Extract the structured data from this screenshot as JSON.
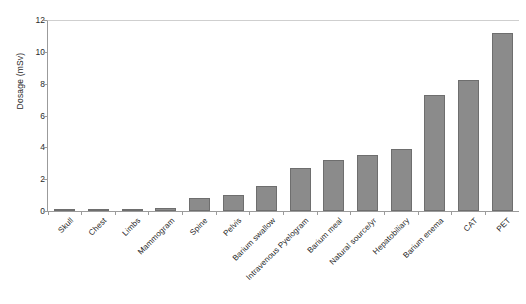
{
  "chart_data": {
    "type": "bar",
    "title": "",
    "xlabel": "",
    "ylabel": "Dosage (mSv)",
    "ylim": [
      0,
      12
    ],
    "yticks": [
      0,
      2,
      4,
      6,
      8,
      10,
      12
    ],
    "grid": false,
    "legend": false,
    "bar_color": "#8b8b8b",
    "bar_edge_color": "#6e6e6e",
    "axis_color": "#9b9b9b",
    "categories": [
      "Skull",
      "Chest",
      "Limbs",
      "Mammogram",
      "Spine",
      "Pelvis",
      "Barium swallow",
      "Intravenous Pyelogram",
      "Barium meal",
      "Natural source/yr",
      "Hepatobiliary",
      "Barium enema",
      "CAT",
      "PET"
    ],
    "values": [
      0.06,
      0.06,
      0.08,
      0.2,
      0.8,
      1.0,
      1.6,
      2.7,
      3.2,
      3.5,
      3.9,
      7.3,
      8.2,
      11.2
    ]
  }
}
